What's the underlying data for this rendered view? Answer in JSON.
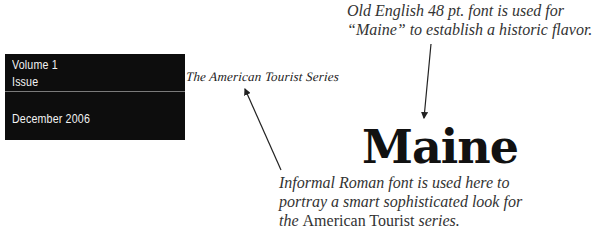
{
  "masthead": {
    "volume": "Volume 1",
    "issue": "Issue",
    "date": "December 2006",
    "background_color": "#0d0d0d",
    "text_color": "#f2f2f2"
  },
  "series_title": "The American Tourist Series",
  "headline": "Maine",
  "annotations": {
    "top": {
      "line1": "Old English 48 pt. font is used for",
      "line2": "“Maine” to establish a historic flavor."
    },
    "bottom": {
      "line1": "Informal Roman font is used here to",
      "line2": "portray a smart sophisticated look for",
      "line3_pre": "the ",
      "line3_roman": "American Tourist",
      "line3_post": " series."
    }
  },
  "arrows": [
    {
      "name": "arrow-to-maine",
      "from": [
        431,
        44
      ],
      "to": [
        424,
        118
      ]
    },
    {
      "name": "arrow-to-series-title",
      "from": [
        281,
        170
      ],
      "to": [
        245,
        89
      ]
    }
  ]
}
